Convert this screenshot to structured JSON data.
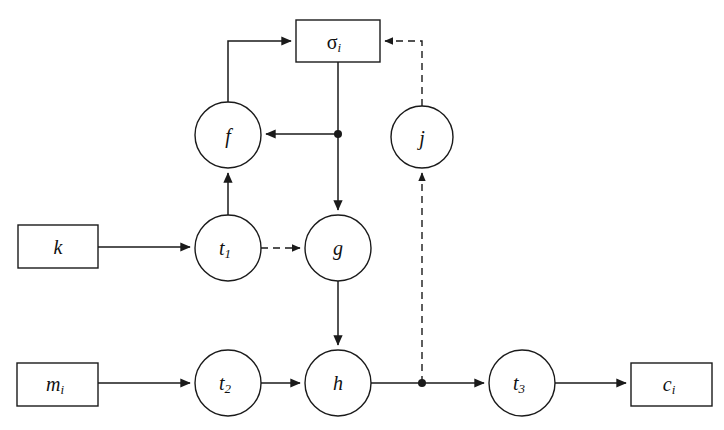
{
  "diagram": {
    "background_color": "#ffffff",
    "line_color": "#1a1a1a",
    "nodes": [
      {
        "id": "sigma_i",
        "label": "σ",
        "subscript": "i",
        "shape": "rect",
        "x": 338,
        "y": 41,
        "w": 84,
        "h": 42,
        "italic": false
      },
      {
        "id": "f",
        "label": "f",
        "subscript": "",
        "shape": "circle",
        "x": 228,
        "y": 135,
        "r": 33,
        "italic": true
      },
      {
        "id": "j",
        "label": "j",
        "subscript": "",
        "shape": "circle",
        "x": 422,
        "y": 137,
        "r": 31,
        "italic": true
      },
      {
        "id": "k",
        "label": "k",
        "subscript": "",
        "shape": "rect",
        "x": 58,
        "y": 246,
        "w": 80,
        "h": 43,
        "italic": true
      },
      {
        "id": "t1",
        "label": "t",
        "subscript": "1",
        "shape": "circle",
        "x": 228,
        "y": 248,
        "r": 33,
        "italic": true
      },
      {
        "id": "g",
        "label": "g",
        "subscript": "",
        "shape": "circle",
        "x": 338,
        "y": 248,
        "r": 33,
        "italic": true
      },
      {
        "id": "m_i",
        "label": "m",
        "subscript": "i",
        "shape": "rect",
        "x": 58,
        "y": 384,
        "w": 81,
        "h": 43,
        "italic": true
      },
      {
        "id": "t2",
        "label": "t",
        "subscript": "2",
        "shape": "circle",
        "x": 228,
        "y": 383,
        "r": 33,
        "italic": true
      },
      {
        "id": "h",
        "label": "h",
        "subscript": "",
        "shape": "circle",
        "x": 338,
        "y": 383,
        "r": 33,
        "italic": true
      },
      {
        "id": "t3",
        "label": "t",
        "subscript": "3",
        "shape": "circle",
        "x": 522,
        "y": 383,
        "r": 33,
        "italic": true
      },
      {
        "id": "c_i",
        "label": "c",
        "subscript": "i",
        "shape": "rect",
        "x": 671,
        "y": 384,
        "w": 81,
        "h": 43,
        "italic": true
      }
    ],
    "junctions": [
      {
        "id": "junction-sigma-branch",
        "x": 338,
        "y": 134,
        "r": 4
      },
      {
        "id": "junction-h-branch",
        "x": 422,
        "y": 383,
        "r": 4
      }
    ],
    "edges": [
      {
        "id": "edge-f-to-sigma",
        "from": "f",
        "to": "sigma_i",
        "style": "solid",
        "arrow": "end"
      },
      {
        "id": "edge-j-to-sigma",
        "from": "j",
        "to": "sigma_i",
        "style": "dashed",
        "arrow": "end"
      },
      {
        "id": "edge-sigma-to-branch",
        "from": "sigma_i",
        "to": "junction-sigma-branch",
        "style": "solid",
        "arrow": "none"
      },
      {
        "id": "edge-branch-to-f",
        "from": "junction-sigma-branch",
        "to": "f",
        "style": "solid",
        "arrow": "end"
      },
      {
        "id": "edge-branch-to-g",
        "from": "junction-sigma-branch",
        "to": "g",
        "style": "solid",
        "arrow": "end"
      },
      {
        "id": "edge-k-to-t1",
        "from": "k",
        "to": "t1",
        "style": "solid",
        "arrow": "end"
      },
      {
        "id": "edge-t1-to-f",
        "from": "t1",
        "to": "f",
        "style": "solid",
        "arrow": "end"
      },
      {
        "id": "edge-t1-to-g",
        "from": "t1",
        "to": "g",
        "style": "dashed",
        "arrow": "end"
      },
      {
        "id": "edge-g-to-h",
        "from": "g",
        "to": "h",
        "style": "solid",
        "arrow": "end"
      },
      {
        "id": "edge-m-to-t2",
        "from": "m_i",
        "to": "t2",
        "style": "solid",
        "arrow": "end"
      },
      {
        "id": "edge-t2-to-h",
        "from": "t2",
        "to": "h",
        "style": "solid",
        "arrow": "end"
      },
      {
        "id": "edge-h-to-t3",
        "from": "h",
        "to": "t3",
        "style": "solid",
        "arrow": "end"
      },
      {
        "id": "edge-t3-to-c",
        "from": "t3",
        "to": "c_i",
        "style": "solid",
        "arrow": "end"
      },
      {
        "id": "edge-branch-to-j",
        "from": "junction-h-branch",
        "to": "j",
        "style": "dashed",
        "arrow": "end"
      }
    ]
  }
}
